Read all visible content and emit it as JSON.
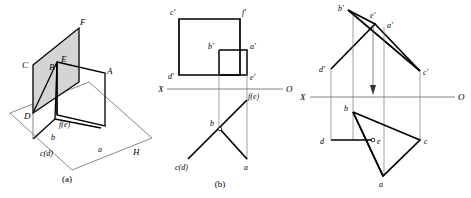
{
  "figure": {
    "width": 471,
    "height": 198,
    "background_color": "#ffffff",
    "line_color": "#000000",
    "thin_line_color": "#666666",
    "shade_color": "#d4d4d4"
  },
  "panels": [
    {
      "id": "a",
      "caption": "(a)",
      "type": "pictorial-3d",
      "labels": {
        "F": "F",
        "C": "C",
        "B": "B",
        "E": "E",
        "A": "A",
        "D": "D",
        "fe": "f(e)",
        "b": "b",
        "cd": "c(d)",
        "a": "a",
        "H": "H"
      }
    },
    {
      "id": "b",
      "caption": "(b)",
      "type": "orthographic-projection",
      "axis": {
        "left_label": "X",
        "right_label": "O"
      },
      "labels": {
        "c_prime": "c'",
        "f_prime": "f'",
        "b_prime": "b'",
        "a_prime": "a'",
        "d_prime": "d'",
        "e_prime": "e'",
        "fe": "f(e)",
        "b": "b",
        "cd": "c(d)",
        "a": "a"
      }
    },
    {
      "id": "c",
      "caption": "",
      "type": "orthographic-projection",
      "axis": {
        "left_label": "X",
        "right_label": "O"
      },
      "labels": {
        "b_prime": "b'",
        "e_prime": "e'",
        "a_prime": "a'",
        "d_prime": "d'",
        "c_prime": "c'",
        "b": "b",
        "d": "d",
        "e": "e",
        "c": "c",
        "a": "a"
      }
    }
  ]
}
